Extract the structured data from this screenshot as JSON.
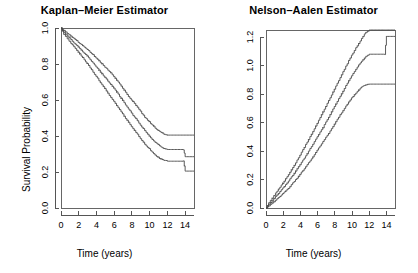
{
  "figure": {
    "width": 418,
    "height": 273,
    "background": "#ffffff",
    "line_color": "#4a4a4a",
    "axis_color": "#555555"
  },
  "panels": [
    {
      "name": "kaplan-meier",
      "title": "Kaplan–Meier Estimator",
      "xlabel": "Time (years)",
      "ylabel": "Survival Probability"
    },
    {
      "name": "nelson-aalen",
      "title": "Nelson–Aalen Estimator",
      "xlabel": "Time (years)",
      "ylabel": "Cumulative Hazard"
    }
  ],
  "chart_data": [
    {
      "type": "line",
      "name": "kaplan-meier",
      "title": "Kaplan–Meier Estimator",
      "xlabel": "Time (years)",
      "ylabel": "Survival Probability",
      "xlim": [
        0,
        15
      ],
      "ylim": [
        0.0,
        1.0
      ],
      "xticks": [
        0,
        2,
        4,
        6,
        8,
        10,
        12,
        14
      ],
      "xtick_labels": [
        "0",
        "2",
        "4",
        "6",
        "8",
        "10",
        "12",
        "14"
      ],
      "yticks": [
        0.0,
        0.2,
        0.4,
        0.6,
        0.8,
        1.0
      ],
      "ytick_labels": [
        "0.0",
        "0.2",
        "0.4",
        "0.6",
        "0.8",
        "1.0"
      ],
      "grid": false,
      "legend": "none",
      "step": true,
      "series": [
        {
          "name": "upper-confidence-band",
          "x": [
            0.0,
            0.3,
            0.7,
            1.1,
            1.6,
            2.1,
            2.6,
            3.1,
            3.6,
            4.1,
            4.6,
            5.1,
            5.6,
            6.1,
            6.6,
            7.1,
            7.6,
            8.1,
            8.6,
            9.1,
            9.6,
            10.1,
            10.6,
            11.1,
            11.6,
            12.0,
            14.0,
            15.0
          ],
          "y": [
            1.0,
            0.985,
            0.97,
            0.955,
            0.935,
            0.915,
            0.895,
            0.875,
            0.85,
            0.825,
            0.8,
            0.775,
            0.75,
            0.72,
            0.69,
            0.655,
            0.62,
            0.59,
            0.56,
            0.525,
            0.495,
            0.47,
            0.445,
            0.425,
            0.41,
            0.405,
            0.405,
            0.405
          ]
        },
        {
          "name": "point-estimate",
          "x": [
            0.0,
            0.3,
            0.7,
            1.1,
            1.6,
            2.1,
            2.6,
            3.1,
            3.6,
            4.1,
            4.6,
            5.1,
            5.6,
            6.1,
            6.6,
            7.1,
            7.6,
            8.1,
            8.6,
            9.1,
            9.6,
            10.1,
            10.6,
            11.1,
            11.6,
            12.0,
            13.8,
            14.0,
            15.0
          ],
          "y": [
            1.0,
            0.975,
            0.955,
            0.935,
            0.91,
            0.885,
            0.86,
            0.835,
            0.805,
            0.775,
            0.745,
            0.715,
            0.685,
            0.655,
            0.62,
            0.585,
            0.55,
            0.515,
            0.485,
            0.45,
            0.42,
            0.39,
            0.365,
            0.345,
            0.33,
            0.325,
            0.325,
            0.285,
            0.285
          ]
        },
        {
          "name": "lower-confidence-band",
          "x": [
            0.0,
            0.3,
            0.7,
            1.1,
            1.6,
            2.1,
            2.6,
            3.1,
            3.6,
            4.1,
            4.6,
            5.1,
            5.6,
            6.1,
            6.6,
            7.1,
            7.6,
            8.1,
            8.6,
            9.1,
            9.6,
            10.1,
            10.6,
            11.1,
            11.6,
            12.0,
            13.8,
            14.0,
            15.0
          ],
          "y": [
            1.0,
            0.965,
            0.94,
            0.915,
            0.885,
            0.855,
            0.825,
            0.79,
            0.755,
            0.72,
            0.685,
            0.65,
            0.615,
            0.58,
            0.545,
            0.51,
            0.475,
            0.44,
            0.41,
            0.375,
            0.345,
            0.32,
            0.295,
            0.275,
            0.265,
            0.26,
            0.26,
            0.205,
            0.205
          ]
        }
      ]
    },
    {
      "type": "line",
      "name": "nelson-aalen",
      "title": "Nelson–Aalen Estimator",
      "xlabel": "Time (years)",
      "ylabel": "Cumulative Hazard",
      "xlim": [
        0,
        15
      ],
      "ylim": [
        0.0,
        1.25
      ],
      "xticks": [
        0,
        2,
        4,
        6,
        8,
        10,
        12,
        14
      ],
      "xtick_labels": [
        "0",
        "2",
        "4",
        "6",
        "8",
        "10",
        "12",
        "14"
      ],
      "yticks": [
        0.0,
        0.2,
        0.4,
        0.6,
        0.8,
        1.0,
        1.2
      ],
      "ytick_labels": [
        "0.0",
        "0.2",
        "0.4",
        "0.6",
        "0.8",
        "1.0",
        "1.2"
      ],
      "grid": false,
      "legend": "none",
      "step": true,
      "series": [
        {
          "name": "upper-confidence-band",
          "x": [
            0.0,
            0.3,
            0.7,
            1.1,
            1.6,
            2.1,
            2.6,
            3.1,
            3.6,
            4.1,
            4.6,
            5.1,
            5.6,
            6.1,
            6.6,
            7.1,
            7.6,
            8.1,
            8.6,
            9.1,
            9.6,
            10.1,
            10.6,
            11.1,
            11.6,
            12.0,
            13.8,
            14.0,
            15.0
          ],
          "y": [
            0.0,
            0.035,
            0.07,
            0.105,
            0.145,
            0.19,
            0.235,
            0.285,
            0.335,
            0.39,
            0.445,
            0.5,
            0.555,
            0.615,
            0.675,
            0.735,
            0.795,
            0.855,
            0.915,
            0.975,
            1.035,
            1.09,
            1.14,
            1.19,
            1.235,
            1.25,
            1.25,
            1.25,
            1.25
          ]
        },
        {
          "name": "point-estimate",
          "x": [
            0.0,
            0.3,
            0.7,
            1.1,
            1.6,
            2.1,
            2.6,
            3.1,
            3.6,
            4.1,
            4.6,
            5.1,
            5.6,
            6.1,
            6.6,
            7.1,
            7.6,
            8.1,
            8.6,
            9.1,
            9.6,
            10.1,
            10.6,
            11.1,
            11.6,
            12.0,
            13.8,
            14.0,
            15.0
          ],
          "y": [
            0.0,
            0.025,
            0.05,
            0.08,
            0.115,
            0.15,
            0.19,
            0.23,
            0.275,
            0.32,
            0.365,
            0.415,
            0.465,
            0.515,
            0.565,
            0.62,
            0.675,
            0.73,
            0.785,
            0.84,
            0.895,
            0.945,
            0.99,
            1.03,
            1.065,
            1.08,
            1.08,
            1.205,
            1.205
          ]
        },
        {
          "name": "lower-confidence-band",
          "x": [
            0.0,
            0.3,
            0.7,
            1.1,
            1.6,
            2.1,
            2.6,
            3.1,
            3.6,
            4.1,
            4.6,
            5.1,
            5.6,
            6.1,
            6.6,
            7.1,
            7.6,
            8.1,
            8.6,
            9.1,
            9.6,
            10.1,
            10.6,
            11.1,
            11.6,
            12.0,
            14.0,
            15.0
          ],
          "y": [
            0.0,
            0.015,
            0.035,
            0.055,
            0.08,
            0.11,
            0.14,
            0.175,
            0.21,
            0.25,
            0.29,
            0.33,
            0.375,
            0.42,
            0.465,
            0.51,
            0.555,
            0.605,
            0.655,
            0.7,
            0.745,
            0.785,
            0.82,
            0.85,
            0.865,
            0.87,
            0.87,
            0.87
          ]
        }
      ]
    }
  ]
}
